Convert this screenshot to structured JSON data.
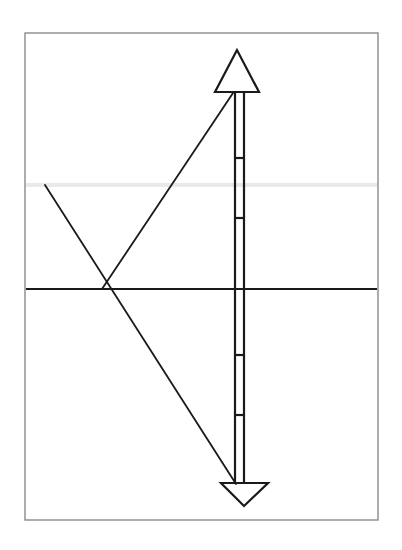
{
  "figure": {
    "canvas": {
      "width": 402,
      "height": 550,
      "background": "#ffffff"
    },
    "frame": {
      "name": "outer-frame",
      "x": 25,
      "y": 33,
      "width": 353,
      "height": 487,
      "stroke": "#8a8a8a",
      "stroke_width": 1.4,
      "fill": "#ffffff"
    },
    "reference_lines": [
      {
        "name": "gray-reference-line",
        "orientation": "horizontal",
        "x1": 26,
        "y1": 185,
        "x2": 377,
        "y2": 185,
        "stroke": "#e9e9e9",
        "stroke_width": 4
      },
      {
        "name": "black-axis-line",
        "orientation": "horizontal",
        "x1": 26,
        "y1": 289,
        "x2": 377,
        "y2": 289,
        "stroke": "#1a1a1a",
        "stroke_width": 1.8
      }
    ],
    "diagonals": [
      {
        "name": "ascending-diagonal",
        "x1": 102,
        "y1": 289,
        "x2": 233,
        "y2": 93,
        "stroke": "#1a1a1a",
        "stroke_width": 1.8
      },
      {
        "name": "descending-diagonal",
        "x1": 45,
        "y1": 185,
        "x2": 236,
        "y2": 484,
        "stroke": "#1a1a1a",
        "stroke_width": 1.8
      }
    ],
    "vertex": {
      "name": "diagonal-intersection",
      "x": 102,
      "y": 289
    },
    "arrow": {
      "name": "double-headed-arrow",
      "stroke": "#1a1a1a",
      "stroke_width": 2.2,
      "shaft": {
        "left_x": 235,
        "right_x": 244,
        "top_y": 92,
        "bottom_y": 484
      },
      "head_top": {
        "name": "arrowhead-up",
        "apex_x": 237,
        "apex_y": 50,
        "base_y": 92,
        "base_left_x": 215,
        "base_right_x": 259
      },
      "head_bottom": {
        "name": "arrowhead-down",
        "apex_x": 244,
        "apex_y": 506,
        "base_y": 483,
        "base_left_x": 221,
        "base_right_x": 268
      },
      "ticks": [
        {
          "name": "tick-1",
          "y": 158
        },
        {
          "name": "tick-2",
          "y": 218
        },
        {
          "name": "tick-3",
          "y": 355
        },
        {
          "name": "tick-4",
          "y": 415
        }
      ]
    }
  },
  "chart_data": {
    "type": "line",
    "xlabel": "",
    "ylabel": "",
    "xlim": [
      25,
      378
    ],
    "ylim": [
      520,
      33
    ],
    "grid": false,
    "legend": "none",
    "series": [
      {
        "name": "gray-reference-line",
        "color": "#e9e9e9",
        "x": [
          26,
          377
        ],
        "y": [
          185,
          185
        ]
      },
      {
        "name": "black-axis-line",
        "color": "#1a1a1a",
        "x": [
          26,
          377
        ],
        "y": [
          289,
          289
        ]
      },
      {
        "name": "ascending-diagonal",
        "color": "#1a1a1a",
        "x": [
          102,
          233
        ],
        "y": [
          289,
          93
        ]
      },
      {
        "name": "descending-diagonal",
        "color": "#1a1a1a",
        "x": [
          45,
          236
        ],
        "y": [
          185,
          484
        ]
      },
      {
        "name": "arrow-shaft-left",
        "color": "#1a1a1a",
        "x": [
          235,
          235
        ],
        "y": [
          92,
          484
        ]
      },
      {
        "name": "arrow-shaft-right",
        "color": "#1a1a1a",
        "x": [
          244,
          244
        ],
        "y": [
          92,
          484
        ]
      }
    ],
    "annotations": [
      {
        "label": "arrowhead-up",
        "x": 237,
        "y": 50
      },
      {
        "label": "arrowhead-down",
        "x": 244,
        "y": 506
      },
      {
        "label": "diagonal-intersection",
        "x": 102,
        "y": 289
      },
      {
        "label": "tick-1",
        "x": 240,
        "y": 158
      },
      {
        "label": "tick-2",
        "x": 240,
        "y": 218
      },
      {
        "label": "tick-3",
        "x": 240,
        "y": 355
      },
      {
        "label": "tick-4",
        "x": 240,
        "y": 415
      }
    ]
  }
}
